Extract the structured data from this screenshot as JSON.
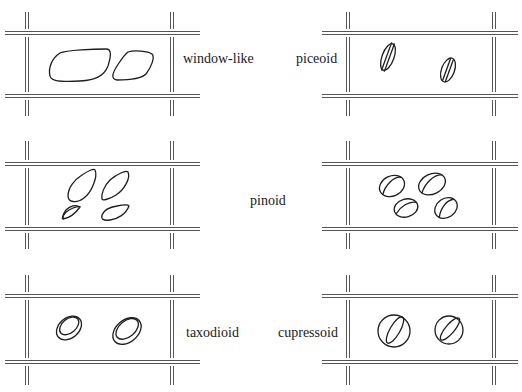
{
  "figure": {
    "panels": [
      {
        "id": "window-like",
        "label": "window-like",
        "column": "left",
        "row": 1,
        "pit_count": 2
      },
      {
        "id": "piceoid",
        "label": "piceoid",
        "column": "right",
        "row": 1,
        "pit_count": 2
      },
      {
        "id": "pinoid",
        "label": "pinoid",
        "column": "both",
        "row": 2,
        "pit_count": 4
      },
      {
        "id": "taxodioid",
        "label": "taxodioid",
        "column": "left",
        "row": 3,
        "pit_count": 2
      },
      {
        "id": "cupressoid",
        "label": "cupressoid",
        "column": "right",
        "row": 3,
        "pit_count": 2
      }
    ],
    "labels": {
      "window_like": "window-like",
      "piceoid": "piceoid",
      "pinoid": "pinoid",
      "taxodioid": "taxodioid",
      "cupressoid": "cupressoid"
    },
    "colors": {
      "background": "#ffffff",
      "line": "#1e1e1e",
      "wall": "#555555"
    }
  }
}
